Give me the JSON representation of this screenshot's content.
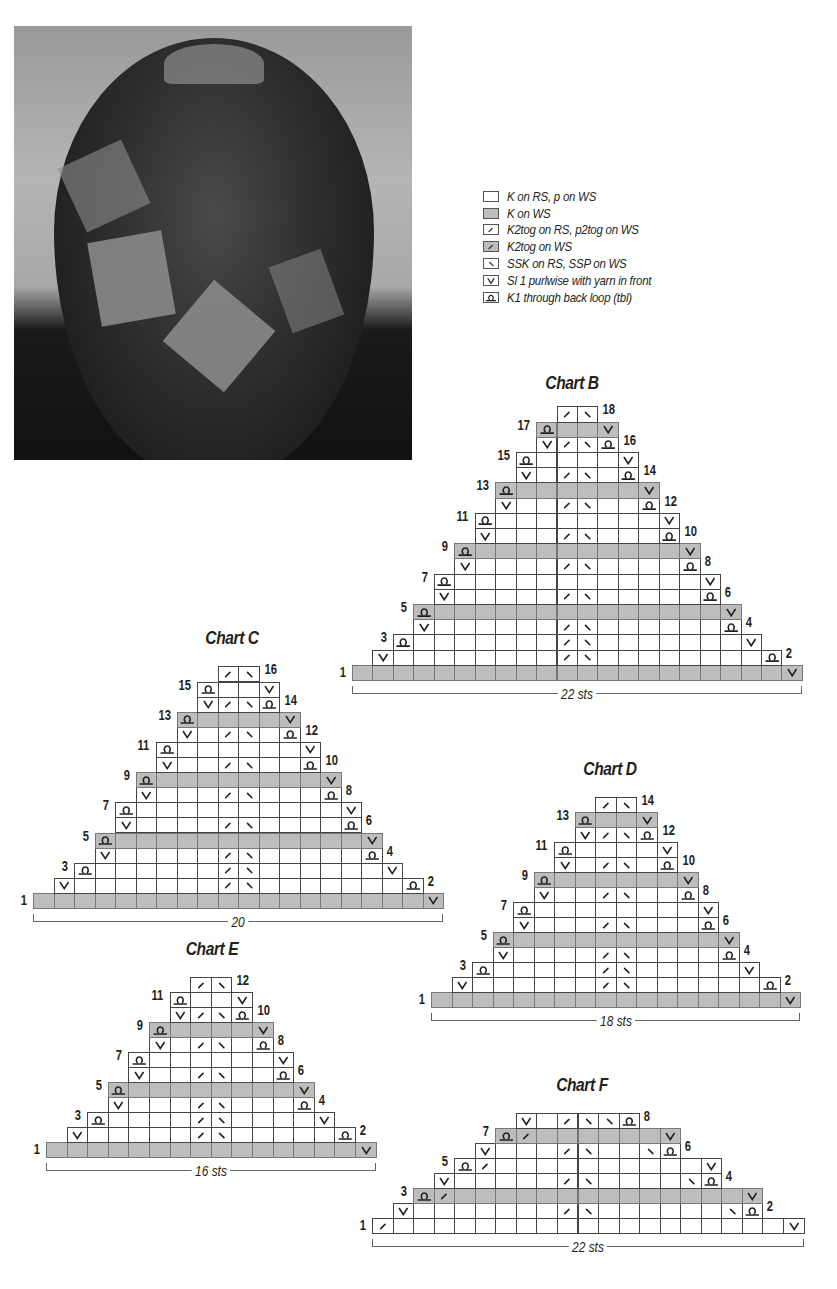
{
  "photo": {
    "alt": "Top view of knitted patchwork hat"
  },
  "legend": [
    {
      "symbol": "blank",
      "shade": false,
      "label": "K on RS, p on WS"
    },
    {
      "symbol": "blank",
      "shade": true,
      "label": "K on WS"
    },
    {
      "symbol": "k2tog",
      "shade": false,
      "label": "K2tog on RS, p2tog on WS"
    },
    {
      "symbol": "k2tog",
      "shade": true,
      "label": "K2tog on WS"
    },
    {
      "symbol": "ssk",
      "shade": false,
      "label": "SSK on RS, SSP on WS"
    },
    {
      "symbol": "slip",
      "shade": false,
      "label": "Sl 1 purlwise with yarn in front"
    },
    {
      "symbol": "tbl",
      "shade": false,
      "label": "K1 through back loop (tbl)"
    }
  ],
  "charts": [
    {
      "id": "B",
      "title": "Chart B",
      "width_label": "22 sts",
      "cols": 22,
      "x": 352,
      "bottom": 680,
      "cell_w": 20.45,
      "cell_h": 15.2,
      "rows": [
        {
          "n": 1,
          "start": 0,
          "end": 21,
          "shade": true,
          "syms": {
            "21": "slip"
          },
          "label_side": "left"
        },
        {
          "n": 2,
          "start": 1,
          "end": 20,
          "shade": false,
          "syms": {
            "1": "slip",
            "10": "k2tog",
            "11": "ssk",
            "20": "tbl"
          },
          "label_side": "right"
        },
        {
          "n": 3,
          "start": 2,
          "end": 19,
          "shade": false,
          "syms": {
            "2": "tbl",
            "10": "k2tog",
            "11": "ssk",
            "19": "slip"
          },
          "label_side": "left"
        },
        {
          "n": 4,
          "start": 3,
          "end": 18,
          "shade": false,
          "syms": {
            "3": "slip",
            "10": "k2tog",
            "11": "ssk",
            "18": "tbl"
          },
          "label_side": "right"
        },
        {
          "n": 5,
          "start": 3,
          "end": 18,
          "shade": true,
          "syms": {
            "3": "tbl",
            "18": "slip"
          },
          "label_side": "left"
        },
        {
          "n": 6,
          "start": 4,
          "end": 17,
          "shade": false,
          "syms": {
            "4": "slip",
            "10": "k2tog",
            "11": "ssk",
            "17": "tbl"
          },
          "label_side": "right"
        },
        {
          "n": 7,
          "start": 4,
          "end": 17,
          "shade": false,
          "syms": {
            "4": "tbl",
            "17": "slip"
          },
          "label_side": "left"
        },
        {
          "n": 8,
          "start": 5,
          "end": 16,
          "shade": false,
          "syms": {
            "5": "slip",
            "10": "k2tog",
            "11": "ssk",
            "16": "tbl"
          },
          "label_side": "right"
        },
        {
          "n": 9,
          "start": 5,
          "end": 16,
          "shade": true,
          "syms": {
            "5": "tbl",
            "16": "slip"
          },
          "label_side": "left"
        },
        {
          "n": 10,
          "start": 6,
          "end": 15,
          "shade": false,
          "syms": {
            "6": "slip",
            "10": "k2tog",
            "11": "ssk",
            "15": "tbl"
          },
          "label_side": "right"
        },
        {
          "n": 11,
          "start": 6,
          "end": 15,
          "shade": false,
          "syms": {
            "6": "tbl",
            "15": "slip"
          },
          "label_side": "left"
        },
        {
          "n": 12,
          "start": 7,
          "end": 14,
          "shade": false,
          "syms": {
            "7": "slip",
            "10": "k2tog",
            "11": "ssk",
            "14": "tbl"
          },
          "label_side": "right"
        },
        {
          "n": 13,
          "start": 7,
          "end": 14,
          "shade": true,
          "syms": {
            "7": "tbl",
            "14": "slip"
          },
          "label_side": "left"
        },
        {
          "n": 14,
          "start": 8,
          "end": 13,
          "shade": false,
          "syms": {
            "8": "slip",
            "10": "k2tog",
            "11": "ssk",
            "13": "tbl"
          },
          "label_side": "right"
        },
        {
          "n": 15,
          "start": 8,
          "end": 13,
          "shade": false,
          "syms": {
            "8": "tbl",
            "13": "slip"
          },
          "label_side": "left"
        },
        {
          "n": 16,
          "start": 9,
          "end": 12,
          "shade": false,
          "syms": {
            "9": "slip",
            "10": "k2tog",
            "11": "ssk",
            "12": "tbl"
          },
          "label_side": "right"
        },
        {
          "n": 17,
          "start": 9,
          "end": 12,
          "shade": true,
          "syms": {
            "9": "tbl",
            "12": "slip"
          },
          "label_side": "left"
        },
        {
          "n": 18,
          "start": 10,
          "end": 11,
          "shade": false,
          "syms": {
            "10": "k2tog",
            "11": "ssk"
          },
          "label_side": "right"
        }
      ]
    },
    {
      "id": "C",
      "title": "Chart C",
      "width_label": "20",
      "cols": 20,
      "x": 33,
      "bottom": 908,
      "cell_w": 20.5,
      "cell_h": 15.1,
      "rows": [
        {
          "n": 1,
          "start": 0,
          "end": 19,
          "shade": true,
          "syms": {
            "19": "slip"
          },
          "label_side": "left"
        },
        {
          "n": 2,
          "start": 1,
          "end": 18,
          "shade": false,
          "syms": {
            "1": "slip",
            "9": "k2tog",
            "10": "ssk",
            "18": "tbl"
          },
          "label_side": "right"
        },
        {
          "n": 3,
          "start": 2,
          "end": 17,
          "shade": false,
          "syms": {
            "2": "tbl",
            "9": "k2tog",
            "10": "ssk",
            "17": "slip"
          },
          "label_side": "left"
        },
        {
          "n": 4,
          "start": 3,
          "end": 16,
          "shade": false,
          "syms": {
            "3": "slip",
            "9": "k2tog",
            "10": "ssk",
            "16": "tbl"
          },
          "label_side": "right"
        },
        {
          "n": 5,
          "start": 3,
          "end": 16,
          "shade": true,
          "syms": {
            "3": "tbl",
            "16": "slip"
          },
          "label_side": "left"
        },
        {
          "n": 6,
          "start": 4,
          "end": 15,
          "shade": false,
          "syms": {
            "4": "slip",
            "9": "k2tog",
            "10": "ssk",
            "15": "tbl"
          },
          "label_side": "right"
        },
        {
          "n": 7,
          "start": 4,
          "end": 15,
          "shade": false,
          "syms": {
            "4": "tbl",
            "15": "slip"
          },
          "label_side": "left"
        },
        {
          "n": 8,
          "start": 5,
          "end": 14,
          "shade": false,
          "syms": {
            "5": "slip",
            "9": "k2tog",
            "10": "ssk",
            "14": "tbl"
          },
          "label_side": "right"
        },
        {
          "n": 9,
          "start": 5,
          "end": 14,
          "shade": true,
          "syms": {
            "5": "tbl",
            "14": "slip"
          },
          "label_side": "left"
        },
        {
          "n": 10,
          "start": 6,
          "end": 13,
          "shade": false,
          "syms": {
            "6": "slip",
            "9": "k2tog",
            "10": "ssk",
            "13": "tbl"
          },
          "label_side": "right"
        },
        {
          "n": 11,
          "start": 6,
          "end": 13,
          "shade": false,
          "syms": {
            "6": "tbl",
            "13": "slip"
          },
          "label_side": "left"
        },
        {
          "n": 12,
          "start": 7,
          "end": 12,
          "shade": false,
          "syms": {
            "7": "slip",
            "9": "k2tog",
            "10": "ssk",
            "12": "tbl"
          },
          "label_side": "right"
        },
        {
          "n": 13,
          "start": 7,
          "end": 12,
          "shade": true,
          "syms": {
            "7": "tbl",
            "12": "slip"
          },
          "label_side": "left"
        },
        {
          "n": 14,
          "start": 8,
          "end": 11,
          "shade": false,
          "syms": {
            "8": "slip",
            "9": "k2tog",
            "10": "ssk",
            "11": "tbl"
          },
          "label_side": "right"
        },
        {
          "n": 15,
          "start": 8,
          "end": 11,
          "shade": false,
          "syms": {
            "8": "tbl",
            "11": "slip"
          },
          "label_side": "left"
        },
        {
          "n": 16,
          "start": 9,
          "end": 10,
          "shade": false,
          "syms": {
            "9": "k2tog",
            "10": "ssk"
          },
          "label_side": "right"
        }
      ]
    },
    {
      "id": "D",
      "title": "Chart D",
      "width_label": "18 sts",
      "cols": 18,
      "x": 431,
      "bottom": 1007,
      "cell_w": 20.5,
      "cell_h": 15.0,
      "rows": [
        {
          "n": 1,
          "start": 0,
          "end": 17,
          "shade": true,
          "syms": {
            "17": "slip"
          },
          "label_side": "left"
        },
        {
          "n": 2,
          "start": 1,
          "end": 16,
          "shade": false,
          "syms": {
            "1": "slip",
            "8": "k2tog",
            "9": "ssk",
            "16": "tbl"
          },
          "label_side": "right"
        },
        {
          "n": 3,
          "start": 2,
          "end": 15,
          "shade": false,
          "syms": {
            "2": "tbl",
            "8": "k2tog",
            "9": "ssk",
            "15": "slip"
          },
          "label_side": "left"
        },
        {
          "n": 4,
          "start": 3,
          "end": 14,
          "shade": false,
          "syms": {
            "3": "slip",
            "8": "k2tog",
            "9": "ssk",
            "14": "tbl"
          },
          "label_side": "right"
        },
        {
          "n": 5,
          "start": 3,
          "end": 14,
          "shade": true,
          "syms": {
            "3": "tbl",
            "14": "slip"
          },
          "label_side": "left"
        },
        {
          "n": 6,
          "start": 4,
          "end": 13,
          "shade": false,
          "syms": {
            "4": "slip",
            "8": "k2tog",
            "9": "ssk",
            "13": "tbl"
          },
          "label_side": "right"
        },
        {
          "n": 7,
          "start": 4,
          "end": 13,
          "shade": false,
          "syms": {
            "4": "tbl",
            "13": "slip"
          },
          "label_side": "left"
        },
        {
          "n": 8,
          "start": 5,
          "end": 12,
          "shade": false,
          "syms": {
            "5": "slip",
            "8": "k2tog",
            "9": "ssk",
            "12": "tbl"
          },
          "label_side": "right"
        },
        {
          "n": 9,
          "start": 5,
          "end": 12,
          "shade": true,
          "syms": {
            "5": "tbl",
            "12": "slip"
          },
          "label_side": "left"
        },
        {
          "n": 10,
          "start": 6,
          "end": 11,
          "shade": false,
          "syms": {
            "6": "slip",
            "8": "k2tog",
            "9": "ssk",
            "11": "tbl"
          },
          "label_side": "right"
        },
        {
          "n": 11,
          "start": 6,
          "end": 11,
          "shade": false,
          "syms": {
            "6": "tbl",
            "11": "slip"
          },
          "label_side": "left"
        },
        {
          "n": 12,
          "start": 7,
          "end": 10,
          "shade": false,
          "syms": {
            "7": "slip",
            "8": "k2tog",
            "9": "ssk",
            "10": "tbl"
          },
          "label_side": "right"
        },
        {
          "n": 13,
          "start": 7,
          "end": 10,
          "shade": true,
          "syms": {
            "7": "tbl",
            "10": "slip"
          },
          "label_side": "left"
        },
        {
          "n": 14,
          "start": 8,
          "end": 9,
          "shade": false,
          "syms": {
            "8": "k2tog",
            "9": "ssk"
          },
          "label_side": "right"
        }
      ]
    },
    {
      "id": "E",
      "title": "Chart E",
      "width_label": "16 sts",
      "cols": 16,
      "x": 46,
      "bottom": 1157,
      "cell_w": 20.6,
      "cell_h": 15.0,
      "rows": [
        {
          "n": 1,
          "start": 0,
          "end": 15,
          "shade": true,
          "syms": {
            "15": "slip"
          },
          "label_side": "left"
        },
        {
          "n": 2,
          "start": 1,
          "end": 14,
          "shade": false,
          "syms": {
            "1": "slip",
            "7": "k2tog",
            "8": "ssk",
            "14": "tbl"
          },
          "label_side": "right"
        },
        {
          "n": 3,
          "start": 2,
          "end": 13,
          "shade": false,
          "syms": {
            "2": "tbl",
            "7": "k2tog",
            "8": "ssk",
            "13": "slip"
          },
          "label_side": "left"
        },
        {
          "n": 4,
          "start": 3,
          "end": 12,
          "shade": false,
          "syms": {
            "3": "slip",
            "7": "k2tog",
            "8": "ssk",
            "12": "tbl"
          },
          "label_side": "right"
        },
        {
          "n": 5,
          "start": 3,
          "end": 12,
          "shade": true,
          "syms": {
            "3": "tbl",
            "12": "slip"
          },
          "label_side": "left"
        },
        {
          "n": 6,
          "start": 4,
          "end": 11,
          "shade": false,
          "syms": {
            "4": "slip",
            "7": "k2tog",
            "8": "ssk",
            "11": "tbl"
          },
          "label_side": "right"
        },
        {
          "n": 7,
          "start": 4,
          "end": 11,
          "shade": false,
          "syms": {
            "4": "tbl",
            "11": "slip"
          },
          "label_side": "left"
        },
        {
          "n": 8,
          "start": 5,
          "end": 10,
          "shade": false,
          "syms": {
            "5": "slip",
            "7": "k2tog",
            "8": "ssk",
            "10": "tbl"
          },
          "label_side": "right"
        },
        {
          "n": 9,
          "start": 5,
          "end": 10,
          "shade": true,
          "syms": {
            "5": "tbl",
            "10": "slip"
          },
          "label_side": "left"
        },
        {
          "n": 10,
          "start": 6,
          "end": 9,
          "shade": false,
          "syms": {
            "6": "slip",
            "7": "k2tog",
            "8": "ssk",
            "9": "tbl"
          },
          "label_side": "right"
        },
        {
          "n": 11,
          "start": 6,
          "end": 9,
          "shade": false,
          "syms": {
            "6": "tbl",
            "9": "slip"
          },
          "label_side": "left"
        },
        {
          "n": 12,
          "start": 7,
          "end": 8,
          "shade": false,
          "syms": {
            "7": "k2tog",
            "8": "ssk"
          },
          "label_side": "right"
        }
      ]
    },
    {
      "id": "F",
      "title": "Chart F",
      "width_label": "22 sts",
      "cols": 21,
      "x": 372,
      "bottom": 1233,
      "cell_w": 20.55,
      "cell_h": 15.0,
      "rows": [
        {
          "n": 1,
          "start": 0,
          "end": 20,
          "shade": false,
          "syms": {
            "0": "k2tog",
            "20": "slip"
          },
          "label_side": "left"
        },
        {
          "n": 2,
          "start": 1,
          "end": 18,
          "shade": false,
          "syms": {
            "1": "slip",
            "9": "k2tog",
            "10": "ssk",
            "17": "ssk",
            "18": "tbl"
          },
          "label_side": "right"
        },
        {
          "n": 3,
          "start": 2,
          "end": 18,
          "shade": true,
          "syms": {
            "2": "tbl",
            "3": "k2tog",
            "18": "slip"
          },
          "label_side": "left"
        },
        {
          "n": 4,
          "start": 3,
          "end": 16,
          "shade": false,
          "syms": {
            "3": "slip",
            "9": "k2tog",
            "10": "ssk",
            "15": "ssk",
            "16": "tbl"
          },
          "label_side": "right"
        },
        {
          "n": 5,
          "start": 4,
          "end": 16,
          "shade": false,
          "syms": {
            "4": "tbl",
            "5": "k2tog",
            "16": "slip"
          },
          "label_side": "left"
        },
        {
          "n": 6,
          "start": 5,
          "end": 14,
          "shade": false,
          "syms": {
            "5": "slip",
            "9": "k2tog",
            "10": "ssk",
            "13": "ssk",
            "14": "tbl"
          },
          "label_side": "right"
        },
        {
          "n": 7,
          "start": 6,
          "end": 14,
          "shade": true,
          "syms": {
            "6": "tbl",
            "7": "k2tog",
            "14": "slip"
          },
          "label_side": "left"
        },
        {
          "n": 8,
          "start": 7,
          "end": 12,
          "shade": false,
          "syms": {
            "7": "slip",
            "9": "k2tog",
            "10": "ssk",
            "11": "ssk",
            "12": "tbl"
          },
          "label_side": "right"
        }
      ]
    }
  ],
  "title_positions": {
    "B": {
      "x": 572,
      "y": 384
    },
    "C": {
      "x": 232,
      "y": 639
    },
    "D": {
      "x": 610,
      "y": 770
    },
    "E": {
      "x": 212,
      "y": 950
    },
    "F": {
      "x": 582,
      "y": 1086
    }
  }
}
